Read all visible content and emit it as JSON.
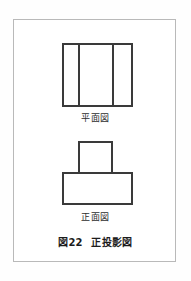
{
  "figure": {
    "caption_prefix": "図",
    "caption_number": "22",
    "caption_title": "正投影図",
    "frame_color": "#b9b9b9",
    "line_color": "#3a3a3a",
    "background": "#ffffff"
  },
  "views": {
    "plan": {
      "label": "平面図"
    },
    "front": {
      "label": "正面図"
    }
  }
}
